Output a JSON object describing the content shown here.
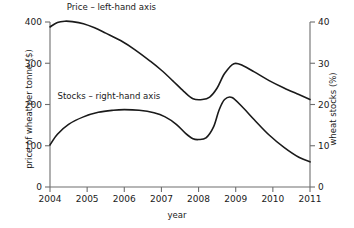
{
  "chart_data": {
    "type": "line",
    "title": "",
    "xlabel": "year",
    "ylabel": "price of wheat per tonne ($)",
    "ylabel_right": "wheat stocks (%)",
    "xlim": [
      2004,
      2011
    ],
    "ylim": [
      0,
      400
    ],
    "ylim_right": [
      0,
      40
    ],
    "grid": false,
    "legend_position": "inside-plot-annotations",
    "xticks": [
      "2004",
      "2005",
      "2006",
      "2007",
      "2008",
      "2009",
      "2010",
      "2011"
    ],
    "yticks_left": [
      "0",
      "100",
      "200",
      "300",
      "400"
    ],
    "yticks_right": [
      "0",
      "10",
      "20",
      "30",
      "40"
    ],
    "annotations": [
      {
        "text": "Price – left-hand axis",
        "x": 2004.45,
        "y": 430
      },
      {
        "text": "Stocks – right-hand axis",
        "x": 2004.2,
        "y": 213
      }
    ],
    "series": [
      {
        "name": "Price – left-hand axis",
        "axis": "left",
        "unit": "$ per tonne",
        "x": [
          2004.0,
          2004.2,
          2004.4,
          2004.6,
          2004.9,
          2005.2,
          2005.5,
          2005.9,
          2006.3,
          2006.7,
          2007.0,
          2007.3,
          2007.6,
          2007.85,
          2008.1,
          2008.3,
          2008.5,
          2008.7,
          2008.95,
          2009.2,
          2009.5,
          2009.9,
          2010.3,
          2010.7,
          2011.0
        ],
        "values": [
          388,
          399,
          402,
          401,
          396,
          386,
          373,
          355,
          332,
          305,
          283,
          258,
          232,
          214,
          212,
          218,
          240,
          275,
          299,
          294,
          279,
          258,
          240,
          224,
          212
        ]
      },
      {
        "name": "Stocks – right-hand axis",
        "axis": "right",
        "unit": "%",
        "x": [
          2004.0,
          2004.2,
          2004.5,
          2004.9,
          2005.3,
          2005.7,
          2006.0,
          2006.4,
          2006.8,
          2007.1,
          2007.4,
          2007.65,
          2007.85,
          2008.0,
          2008.2,
          2008.4,
          2008.55,
          2008.7,
          2008.9,
          2009.2,
          2009.5,
          2009.9,
          2010.3,
          2010.7,
          2011.0
        ],
        "values": [
          10.2,
          12.8,
          15.2,
          17.0,
          18.1,
          18.6,
          18.75,
          18.6,
          18.0,
          17.0,
          15.2,
          13.0,
          11.7,
          11.5,
          11.9,
          14.5,
          18.6,
          21.2,
          21.7,
          19.2,
          16.3,
          12.6,
          9.6,
          7.2,
          6.1
        ]
      }
    ]
  },
  "axis_labels": {
    "left": "price of wheat per tonne ($)",
    "right": "wheat stocks (%)",
    "bottom": "year"
  },
  "colors": {
    "curve": "#1a1a1a",
    "axis": "#6e6e6e",
    "background": "#ffffff"
  }
}
